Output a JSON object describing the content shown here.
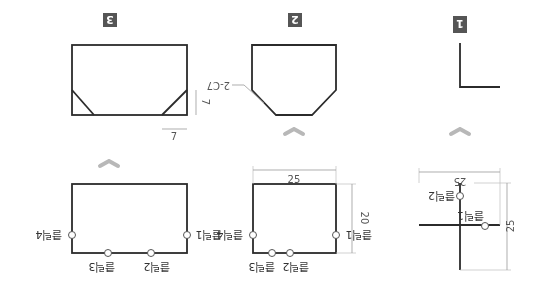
{
  "steps": [
    {
      "number": "1",
      "clicks": [
        "클릭1",
        "클릭2"
      ],
      "dimensions": {
        "width": "25",
        "height": "25"
      }
    },
    {
      "number": "2",
      "clicks": [
        "클릭1",
        "클릭2",
        "클릭3",
        "클릭4"
      ],
      "dimensions": {
        "width": "25",
        "height": "20"
      },
      "chamfer_note": "2-C7"
    },
    {
      "number": "3",
      "clicks": [
        "클릭1",
        "클릭2",
        "클릭3",
        "클릭4"
      ],
      "dimensions": {
        "chamfer_h": "7",
        "chamfer_v": "7"
      }
    }
  ],
  "colors": {
    "badge": "#555555",
    "shape_stroke": "#2b2b2b",
    "arrow": "#b8b8b8"
  }
}
